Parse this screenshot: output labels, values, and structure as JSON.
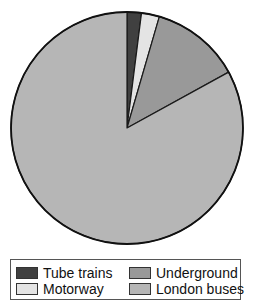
{
  "chart_data": {
    "type": "pie",
    "title": "",
    "start_angle_deg": 0,
    "direction": "clockwise",
    "categories": [
      "Tube trains",
      "Motorway",
      "Underground",
      "London buses"
    ],
    "values": [
      2,
      2.5,
      12.5,
      83
    ],
    "colors": [
      "#404040",
      "#e4e4e4",
      "#999999",
      "#b6b6b6"
    ],
    "legend_position": "bottom",
    "legend_layout": "2x2 grid",
    "slice_order_clockwise_from_top": [
      "Tube trains",
      "Motorway",
      "Underground",
      "London buses"
    ]
  },
  "legend": {
    "items": [
      {
        "label": "Tube trains",
        "color": "#404040"
      },
      {
        "label": "Underground",
        "color": "#999999"
      },
      {
        "label": "Motorway",
        "color": "#e4e4e4"
      },
      {
        "label": "London buses",
        "color": "#b6b6b6"
      }
    ]
  }
}
